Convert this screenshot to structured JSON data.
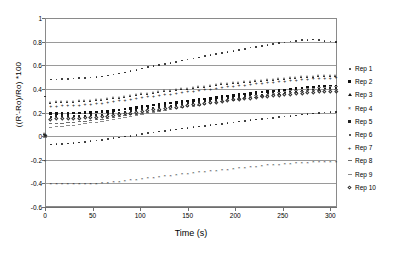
{
  "chart_data": {
    "type": "scatter",
    "title": "",
    "xlabel": "Time (s)",
    "ylabel": "((R'-Ro)/Ro) *100",
    "xlim": [
      0,
      307
    ],
    "ylim": [
      -0.6,
      1
    ],
    "xticks": [
      0,
      50,
      100,
      150,
      200,
      250,
      300
    ],
    "xtick_labels": [
      "0",
      "50",
      "100",
      "150",
      "200",
      "250",
      "300"
    ],
    "yticks": [
      -0.6,
      -0.4,
      -0.2,
      0,
      0.2,
      0.4,
      0.6,
      0.8,
      1
    ],
    "ytick_labels": [
      "-0.6",
      "-0.4",
      "-0.2",
      "0",
      "0.2",
      "0.4",
      "0.6",
      "0.8",
      "1"
    ],
    "grid": true,
    "grid_axis": "y",
    "legend_position": "right",
    "series": [
      {
        "name": "Rep 1",
        "marker": "dot",
        "x": [
          0,
          6,
          12,
          18,
          24,
          30,
          36,
          42,
          48,
          54,
          60,
          66,
          72,
          78,
          84,
          90,
          96,
          102,
          108,
          114,
          120,
          126,
          132,
          138,
          144,
          150,
          156,
          162,
          168,
          174,
          180,
          186,
          192,
          198,
          204,
          210,
          216,
          222,
          228,
          234,
          240,
          246,
          252,
          258,
          264,
          270,
          276,
          282,
          288,
          294,
          300,
          306
        ],
        "y": [
          0.335,
          0.48,
          0.481,
          0.483,
          0.484,
          0.487,
          0.49,
          0.492,
          0.495,
          0.5,
          0.506,
          0.512,
          0.52,
          0.529,
          0.539,
          0.55,
          0.562,
          0.574,
          0.585,
          0.594,
          0.603,
          0.611,
          0.62,
          0.629,
          0.639,
          0.648,
          0.658,
          0.667,
          0.677,
          0.686,
          0.695,
          0.704,
          0.713,
          0.722,
          0.731,
          0.74,
          0.749,
          0.757,
          0.765,
          0.773,
          0.78,
          0.787,
          0.794,
          0.801,
          0.807,
          0.812,
          0.816,
          0.818,
          0.814,
          0.806,
          0.8,
          0.798
        ]
      },
      {
        "name": "Rep 2",
        "marker": "square",
        "x": [
          0,
          6,
          12,
          18,
          24,
          30,
          36,
          42,
          48,
          54,
          60,
          66,
          72,
          78,
          84,
          90,
          96,
          102,
          108,
          114,
          120,
          126,
          132,
          138,
          144,
          150,
          156,
          162,
          168,
          174,
          180,
          186,
          192,
          198,
          204,
          210,
          216,
          222,
          228,
          234,
          240,
          246,
          252,
          258,
          264,
          270,
          276,
          282,
          288,
          294,
          300,
          306
        ],
        "y": [
          0.01,
          0.19,
          0.192,
          0.193,
          0.194,
          0.196,
          0.197,
          0.198,
          0.2,
          0.203,
          0.206,
          0.21,
          0.215,
          0.221,
          0.228,
          0.235,
          0.242,
          0.249,
          0.256,
          0.262,
          0.268,
          0.274,
          0.28,
          0.286,
          0.292,
          0.298,
          0.303,
          0.309,
          0.315,
          0.321,
          0.327,
          0.333,
          0.339,
          0.345,
          0.351,
          0.357,
          0.362,
          0.367,
          0.372,
          0.377,
          0.382,
          0.387,
          0.392,
          0.397,
          0.402,
          0.407,
          0.411,
          0.415,
          0.418,
          0.421,
          0.424,
          0.426
        ]
      },
      {
        "name": "Rep 3",
        "marker": "triangle",
        "x": [
          0,
          6,
          12,
          18,
          24,
          30,
          36,
          42,
          48,
          54,
          60,
          66,
          72,
          78,
          84,
          90,
          96,
          102,
          108,
          114,
          120,
          126,
          132,
          138,
          144,
          150,
          156,
          162,
          168,
          174,
          180,
          186,
          192,
          198,
          204,
          210,
          216,
          222,
          228,
          234,
          240,
          246,
          252,
          258,
          264,
          270,
          276,
          282,
          288,
          294,
          300,
          306
        ],
        "y": [
          0.02,
          0.285,
          0.288,
          0.29,
          0.292,
          0.294,
          0.296,
          0.298,
          0.301,
          0.305,
          0.309,
          0.314,
          0.32,
          0.327,
          0.334,
          0.341,
          0.348,
          0.355,
          0.361,
          0.367,
          0.373,
          0.379,
          0.385,
          0.391,
          0.397,
          0.403,
          0.409,
          0.415,
          0.421,
          0.427,
          0.433,
          0.438,
          0.443,
          0.448,
          0.453,
          0.458,
          0.463,
          0.467,
          0.471,
          0.475,
          0.479,
          0.483,
          0.487,
          0.491,
          0.495,
          0.498,
          0.501,
          0.504,
          0.507,
          0.509,
          0.511,
          0.513
        ]
      },
      {
        "name": "Rep 4",
        "marker": "x",
        "x": [
          0,
          6,
          12,
          18,
          24,
          30,
          36,
          42,
          48,
          54,
          60,
          66,
          72,
          78,
          84,
          90,
          96,
          102,
          108,
          114,
          120,
          126,
          132,
          138,
          144,
          150,
          156,
          162,
          168,
          174,
          180,
          186,
          192,
          198,
          204,
          210,
          216,
          222,
          228,
          234,
          240,
          246,
          252,
          258,
          264,
          270,
          276,
          282,
          288,
          294,
          300,
          306
        ],
        "y": [
          -0.21,
          -0.4,
          -0.401,
          -0.402,
          -0.403,
          -0.404,
          -0.404,
          -0.403,
          -0.402,
          -0.4,
          -0.397,
          -0.393,
          -0.389,
          -0.384,
          -0.379,
          -0.373,
          -0.367,
          -0.361,
          -0.355,
          -0.349,
          -0.343,
          -0.337,
          -0.331,
          -0.326,
          -0.32,
          -0.315,
          -0.31,
          -0.305,
          -0.3,
          -0.295,
          -0.29,
          -0.285,
          -0.28,
          -0.276,
          -0.271,
          -0.266,
          -0.261,
          -0.256,
          -0.251,
          -0.246,
          -0.242,
          -0.238,
          -0.234,
          -0.23,
          -0.227,
          -0.224,
          -0.222,
          -0.22,
          -0.219,
          -0.218,
          -0.217,
          -0.216
        ]
      },
      {
        "name": "Rep 5",
        "marker": "square-small",
        "x": [
          0,
          6,
          12,
          18,
          24,
          30,
          36,
          42,
          48,
          54,
          60,
          66,
          72,
          78,
          84,
          90,
          96,
          102,
          108,
          114,
          120,
          126,
          132,
          138,
          144,
          150,
          156,
          162,
          168,
          174,
          180,
          186,
          192,
          198,
          204,
          210,
          216,
          222,
          228,
          234,
          240,
          246,
          252,
          258,
          264,
          270,
          276,
          282,
          288,
          294,
          300,
          306
        ],
        "y": [
          0.0,
          0.165,
          0.167,
          0.168,
          0.169,
          0.171,
          0.172,
          0.174,
          0.176,
          0.179,
          0.183,
          0.188,
          0.194,
          0.2,
          0.207,
          0.214,
          0.221,
          0.228,
          0.235,
          0.241,
          0.247,
          0.253,
          0.259,
          0.265,
          0.271,
          0.277,
          0.283,
          0.289,
          0.295,
          0.301,
          0.307,
          0.313,
          0.319,
          0.325,
          0.331,
          0.337,
          0.342,
          0.347,
          0.352,
          0.357,
          0.362,
          0.367,
          0.372,
          0.377,
          0.382,
          0.387,
          0.391,
          0.395,
          0.398,
          0.401,
          0.404,
          0.406
        ]
      },
      {
        "name": "Rep 6",
        "marker": "dot",
        "x": [
          0,
          6,
          12,
          18,
          24,
          30,
          36,
          42,
          48,
          54,
          60,
          66,
          72,
          78,
          84,
          90,
          96,
          102,
          108,
          114,
          120,
          126,
          132,
          138,
          144,
          150,
          156,
          162,
          168,
          174,
          180,
          186,
          192,
          198,
          204,
          210,
          216,
          222,
          228,
          234,
          240,
          246,
          252,
          258,
          264,
          270,
          276,
          282,
          288,
          294,
          300,
          306
        ],
        "y": [
          -0.01,
          -0.07,
          -0.068,
          -0.065,
          -0.062,
          -0.058,
          -0.053,
          -0.048,
          -0.043,
          -0.037,
          -0.031,
          -0.025,
          -0.018,
          -0.011,
          -0.004,
          0.003,
          0.01,
          0.017,
          0.024,
          0.031,
          0.038,
          0.045,
          0.051,
          0.057,
          0.063,
          0.069,
          0.075,
          0.081,
          0.087,
          0.093,
          0.099,
          0.105,
          0.111,
          0.117,
          0.123,
          0.129,
          0.135,
          0.14,
          0.145,
          0.15,
          0.155,
          0.16,
          0.165,
          0.17,
          0.176,
          0.182,
          0.188,
          0.193,
          0.197,
          0.2,
          0.202,
          0.203
        ]
      },
      {
        "name": "Rep 7",
        "marker": "plus",
        "x": [
          0,
          6,
          12,
          18,
          24,
          30,
          36,
          42,
          48,
          54,
          60,
          66,
          72,
          78,
          84,
          90,
          96,
          102,
          108,
          114,
          120,
          126,
          132,
          138,
          144,
          150,
          156,
          162,
          168,
          174,
          180,
          186,
          192,
          198,
          204,
          210,
          216,
          222,
          228,
          234,
          240,
          246,
          252,
          258,
          264,
          270,
          276,
          282,
          288,
          294,
          300,
          306
        ],
        "y": [
          0.015,
          0.25,
          0.252,
          0.254,
          0.256,
          0.258,
          0.26,
          0.263,
          0.266,
          0.27,
          0.275,
          0.281,
          0.288,
          0.295,
          0.302,
          0.309,
          0.316,
          0.323,
          0.33,
          0.336,
          0.342,
          0.348,
          0.354,
          0.36,
          0.366,
          0.372,
          0.378,
          0.384,
          0.39,
          0.396,
          0.402,
          0.408,
          0.414,
          0.42,
          0.425,
          0.43,
          0.435,
          0.44,
          0.445,
          0.45,
          0.455,
          0.46,
          0.464,
          0.468,
          0.472,
          0.476,
          0.479,
          0.482,
          0.485,
          0.487,
          0.489,
          0.491
        ]
      },
      {
        "name": "Rep 8",
        "marker": "dash",
        "x": [
          0,
          6,
          12,
          18,
          24,
          30,
          36,
          42,
          48,
          54,
          60,
          66,
          72,
          78,
          84,
          90,
          96,
          102,
          108,
          114,
          120,
          126,
          132,
          138,
          144,
          150,
          156,
          162,
          168,
          174,
          180,
          186,
          192,
          198,
          204,
          210,
          216,
          222,
          228,
          234,
          240,
          246,
          252,
          258,
          264,
          270,
          276,
          282,
          288,
          294,
          300,
          306
        ],
        "y": [
          -0.005,
          0.105,
          0.108,
          0.111,
          0.114,
          0.118,
          0.122,
          0.127,
          0.132,
          0.138,
          0.144,
          0.151,
          0.158,
          0.165,
          0.172,
          0.179,
          0.186,
          0.193,
          0.2,
          0.207,
          0.214,
          0.221,
          0.228,
          0.235,
          0.242,
          0.249,
          0.256,
          0.263,
          0.27,
          0.277,
          0.284,
          0.291,
          0.298,
          0.305,
          0.312,
          0.319,
          0.325,
          0.331,
          0.337,
          0.343,
          0.349,
          0.355,
          0.361,
          0.367,
          0.373,
          0.378,
          0.383,
          0.387,
          0.39,
          0.392,
          0.394,
          0.395
        ]
      },
      {
        "name": "Rep 9",
        "marker": "dash-light",
        "x": [
          0,
          6,
          12,
          18,
          24,
          30,
          36,
          42,
          48,
          54,
          60,
          66,
          72,
          78,
          84,
          90,
          96,
          102,
          108,
          114,
          120,
          126,
          132,
          138,
          144,
          150,
          156,
          162,
          168,
          174,
          180,
          186,
          192,
          198,
          204,
          210,
          216,
          222,
          228,
          234,
          240,
          246,
          252,
          258,
          264,
          270,
          276,
          282,
          288,
          294,
          300,
          306
        ],
        "y": [
          -0.008,
          0.075,
          0.079,
          0.083,
          0.088,
          0.093,
          0.099,
          0.105,
          0.112,
          0.119,
          0.127,
          0.135,
          0.143,
          0.151,
          0.159,
          0.167,
          0.175,
          0.183,
          0.191,
          0.199,
          0.207,
          0.215,
          0.223,
          0.231,
          0.239,
          0.247,
          0.255,
          0.263,
          0.271,
          0.279,
          0.287,
          0.295,
          0.303,
          0.311,
          0.319,
          0.327,
          0.334,
          0.341,
          0.348,
          0.355,
          0.362,
          0.369,
          0.376,
          0.383,
          0.39,
          0.396,
          0.402,
          0.407,
          0.411,
          0.414,
          0.417,
          0.419
        ]
      },
      {
        "name": "Rep 10",
        "marker": "diamond",
        "x": [
          0,
          6,
          12,
          18,
          24,
          30,
          36,
          42,
          48,
          54,
          60,
          66,
          72,
          78,
          84,
          90,
          96,
          102,
          108,
          114,
          120,
          126,
          132,
          138,
          144,
          150,
          156,
          162,
          168,
          174,
          180,
          186,
          192,
          198,
          204,
          210,
          216,
          222,
          228,
          234,
          240,
          246,
          252,
          258,
          264,
          270,
          276,
          282,
          288,
          294,
          300,
          306
        ],
        "y": [
          0.005,
          0.145,
          0.147,
          0.148,
          0.15,
          0.152,
          0.154,
          0.156,
          0.159,
          0.162,
          0.166,
          0.171,
          0.177,
          0.183,
          0.19,
          0.197,
          0.204,
          0.211,
          0.218,
          0.224,
          0.23,
          0.236,
          0.242,
          0.248,
          0.254,
          0.26,
          0.266,
          0.272,
          0.278,
          0.284,
          0.29,
          0.296,
          0.302,
          0.308,
          0.313,
          0.318,
          0.323,
          0.328,
          0.333,
          0.338,
          0.343,
          0.348,
          0.353,
          0.358,
          0.362,
          0.366,
          0.37,
          0.373,
          0.376,
          0.378,
          0.38,
          0.382
        ]
      }
    ]
  }
}
